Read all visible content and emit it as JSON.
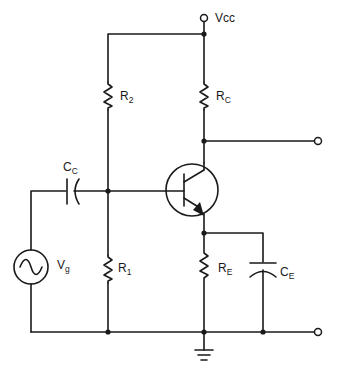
{
  "diagram": {
    "supply": {
      "label": "Vcc"
    },
    "components": [
      {
        "id": "R2",
        "type": "resistor",
        "label": "R",
        "subscript": "2"
      },
      {
        "id": "RC",
        "type": "resistor",
        "label": "R",
        "subscript": "C"
      },
      {
        "id": "R1",
        "type": "resistor",
        "label": "R",
        "subscript": "1"
      },
      {
        "id": "RE",
        "type": "resistor",
        "label": "R",
        "subscript": "E"
      },
      {
        "id": "CC",
        "type": "capacitor",
        "label": "C",
        "subscript": "C"
      },
      {
        "id": "CE",
        "type": "capacitor",
        "label": "C",
        "subscript": "E"
      },
      {
        "id": "Vg",
        "type": "ac-source",
        "label": "V",
        "subscript": "g"
      },
      {
        "id": "Q1",
        "type": "npn-transistor",
        "label": ""
      }
    ],
    "terminals": [
      "vcc-terminal",
      "output-terminal",
      "ground-rail-terminal"
    ]
  }
}
